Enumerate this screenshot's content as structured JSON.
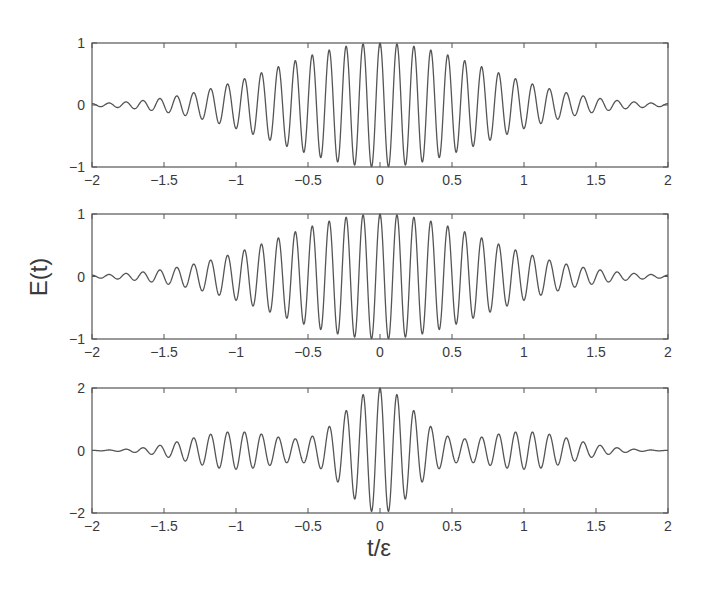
{
  "chart_data": [
    {
      "type": "line",
      "title": "",
      "xlabel": "",
      "ylabel": "",
      "xlim": [
        -2,
        2
      ],
      "ylim": [
        -1,
        1
      ],
      "x_ticks": [
        -2,
        -1.5,
        -1,
        -0.5,
        0,
        0.5,
        1,
        1.5,
        2
      ],
      "x_tick_labels": [
        "−2",
        "−1.5",
        "−1",
        "−0.5",
        "0",
        "0.5",
        "1",
        "1.5",
        "2"
      ],
      "y_ticks": [
        -1,
        0,
        1
      ],
      "y_tick_labels": [
        "−1",
        "0",
        "1"
      ],
      "grid": false,
      "description": "Gaussian-enveloped oscillation, peak amplitude 1 at t=0, about 34 visible cycles over [-2,2]",
      "series": [
        {
          "name": "E(t)",
          "model": {
            "kind": "gaussian_carrier",
            "amplitude": 1.0,
            "sigma": 0.72,
            "frequency": 8.5,
            "phase": 0
          },
          "sample_points": {
            "x": [
              -2,
              -1.5,
              -1,
              -0.5,
              0,
              0.5,
              1,
              1.5,
              2
            ],
            "envelope": [
              0.03,
              0.12,
              0.38,
              0.79,
              1.0,
              0.79,
              0.38,
              0.12,
              0.03
            ]
          }
        }
      ]
    },
    {
      "type": "line",
      "title": "",
      "xlabel": "",
      "ylabel": "E(t)",
      "xlim": [
        -2,
        2
      ],
      "ylim": [
        -1,
        1
      ],
      "x_ticks": [
        -2,
        -1.5,
        -1,
        -0.5,
        0,
        0.5,
        1,
        1.5,
        2
      ],
      "x_tick_labels": [
        "−2",
        "−1.5",
        "−1",
        "−0.5",
        "0",
        "0.5",
        "1",
        "1.5",
        "2"
      ],
      "y_ticks": [
        -1,
        0,
        1
      ],
      "y_tick_labels": [
        "−1",
        "0",
        "1"
      ],
      "grid": false,
      "description": "Gaussian-enveloped oscillation nearly identical to the top panel",
      "series": [
        {
          "name": "E(t)",
          "model": {
            "kind": "gaussian_carrier",
            "amplitude": 1.0,
            "sigma": 0.72,
            "frequency": 8.5,
            "phase": 0
          },
          "sample_points": {
            "x": [
              -2,
              -1.5,
              -1,
              -0.5,
              0,
              0.5,
              1,
              1.5,
              2
            ],
            "envelope": [
              0.03,
              0.12,
              0.38,
              0.79,
              1.0,
              0.79,
              0.38,
              0.12,
              0.03
            ]
          }
        }
      ]
    },
    {
      "type": "line",
      "title": "",
      "xlabel": "t/ε",
      "ylabel": "",
      "xlim": [
        -2,
        2
      ],
      "ylim": [
        -2,
        2
      ],
      "x_ticks": [
        -2,
        -1.5,
        -1,
        -0.5,
        0,
        0.5,
        1,
        1.5,
        2
      ],
      "x_tick_labels": [
        "−2",
        "−1.5",
        "−1",
        "−0.5",
        "0",
        "0.5",
        "1",
        "1.5",
        "2"
      ],
      "y_ticks": [
        -2,
        0,
        2
      ],
      "y_tick_labels": [
        "−2",
        "0",
        "2"
      ],
      "grid": false,
      "description": "Central pulse of amplitude ~2 for |t|<0.5, plus side lobes of amplitude ~0.6 for 0.6<|t|<1.7, flat near |t|=2",
      "series": [
        {
          "name": "E(t)",
          "model": {
            "kind": "two_component",
            "frequency": 8.5,
            "central": {
              "amplitude": 2.0,
              "sigma": 0.24
            },
            "side": {
              "amplitude": 0.6,
              "center": 1.0,
              "sigma": 0.33
            }
          },
          "sample_points": {
            "x": [
              -2,
              -1.5,
              -1,
              -0.55,
              -0.25,
              0,
              0.25,
              0.55,
              1,
              1.5,
              2
            ],
            "envelope": [
              0.0,
              0.25,
              0.6,
              0.15,
              1.2,
              2.0,
              1.2,
              0.15,
              0.6,
              0.25,
              0.0
            ]
          }
        }
      ]
    }
  ],
  "figure": {
    "ylabel": "E(t)",
    "xlabel": "t/ε"
  }
}
